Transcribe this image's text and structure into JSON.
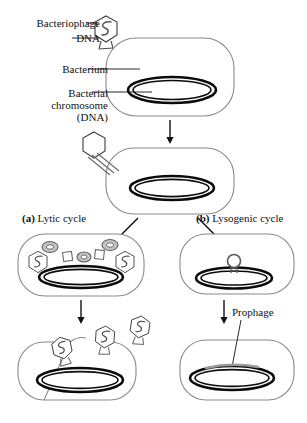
{
  "diagram": {
    "colors": {
      "outline": "#444444",
      "dark_outline": "#111111",
      "chromosome": "#000000",
      "part_fill": "#b9b9b9",
      "background": "#ffffff"
    },
    "labels": {
      "bacteriophage": "Bacteriophage",
      "dna": "DNA",
      "bacterium": "Bacterium",
      "bacterial_chromosome_line1": "Bacterial",
      "bacterial_chromosome_line2": "chromosome",
      "bacterial_chromosome_line3": "(DNA)",
      "lytic_marker": "(a)",
      "lytic_cycle": "Lytic cycle",
      "lysogenic_marker": "(b)",
      "lysogenic_cycle": "Lysogenic cycle",
      "prophage": "Prophage"
    },
    "stages": [
      {
        "id": "attachment",
        "caption": "Bacteriophage attaches to bacterium",
        "phage_count": 1,
        "chromosome": true
      },
      {
        "id": "injection",
        "caption": "Phage injects DNA into bacterium",
        "phage_count": 1,
        "chromosome": true
      },
      {
        "id": "lytic-assembly",
        "caption": "New phage parts assemble inside host",
        "phage_heads": 2,
        "rings": 3,
        "squares": 2,
        "chromosome": true
      },
      {
        "id": "lysogenic-integration",
        "caption": "Phage DNA forms a circle and integrates",
        "phage_loops": 1,
        "chromosome": true
      },
      {
        "id": "lysis",
        "caption": "Cell lyses and releases new phages",
        "released_phages": 3,
        "chromosome": true
      },
      {
        "id": "prophage",
        "caption": "Prophage carried in bacterial chromosome",
        "chromosome": true
      }
    ]
  }
}
